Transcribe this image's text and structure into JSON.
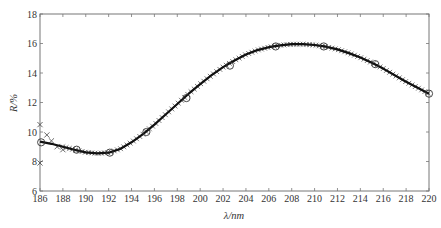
{
  "chart_data": {
    "type": "line",
    "title": "",
    "xlabel": "λ/nm",
    "ylabel": "R/%",
    "xlim": [
      186,
      220
    ],
    "ylim": [
      6,
      18
    ],
    "x_ticks": [
      186,
      188,
      190,
      192,
      194,
      196,
      198,
      200,
      202,
      204,
      206,
      208,
      210,
      212,
      214,
      216,
      218,
      220
    ],
    "y_ticks": [
      6,
      8,
      10,
      12,
      14,
      16,
      18
    ],
    "grid": false,
    "legend": null,
    "series": [
      {
        "name": "fit-curve",
        "style": "solid-line",
        "color": "#111111",
        "x": [
          186,
          187,
          188,
          189,
          190,
          191,
          192,
          193,
          194,
          195,
          196,
          197,
          198,
          199,
          200,
          201,
          202,
          203,
          204,
          205,
          206,
          207,
          208,
          209,
          210,
          211,
          212,
          213,
          214,
          215,
          216,
          217,
          218,
          219,
          220
        ],
        "y": [
          9.35,
          9.2,
          9.0,
          8.8,
          8.62,
          8.55,
          8.6,
          8.85,
          9.3,
          9.85,
          10.5,
          11.2,
          11.9,
          12.6,
          13.25,
          13.85,
          14.4,
          14.85,
          15.25,
          15.55,
          15.75,
          15.88,
          15.95,
          15.95,
          15.9,
          15.78,
          15.6,
          15.35,
          15.05,
          14.7,
          14.3,
          13.85,
          13.4,
          13.0,
          12.6
        ]
      },
      {
        "name": "circle-markers",
        "style": "open-circle",
        "color": "#333333",
        "x": [
          186.1,
          189.2,
          192.1,
          195.3,
          198.8,
          202.6,
          206.6,
          210.8,
          215.3,
          220
        ],
        "y": [
          9.3,
          8.8,
          8.6,
          10.0,
          12.3,
          14.5,
          15.8,
          15.8,
          14.6,
          12.6
        ]
      },
      {
        "name": "cross-markers",
        "style": "x-marker",
        "color": "#444444",
        "x": [
          186.0,
          186.0,
          186.6,
          187.0,
          187.5,
          188.0
        ],
        "y": [
          10.5,
          7.9,
          9.8,
          9.4,
          9.0,
          8.8
        ],
        "note": "dense x markers follow the curve from 188 to 220"
      }
    ]
  }
}
